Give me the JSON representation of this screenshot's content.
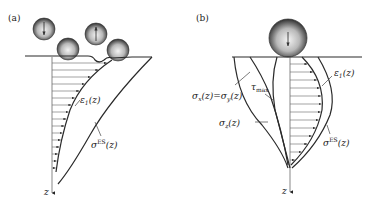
{
  "panels": [
    {
      "id": "a",
      "label": "(a)",
      "curve_labels": {
        "eps_main": "ε",
        "eps_sub": "1",
        "eps_arg": "(z)",
        "sigma_main": "σ",
        "sigma_sup": "ES",
        "sigma_arg": "(z)"
      },
      "axis_label": "z",
      "spheres": [
        {
          "role": "falling",
          "arrow": "down"
        },
        {
          "role": "resting"
        },
        {
          "role": "rebounding",
          "arrow": "up"
        },
        {
          "role": "resting"
        }
      ]
    },
    {
      "id": "b",
      "label": "(b)",
      "curve_labels": {
        "sxy": "σx(z)=σy(z)",
        "sxy_a": "σ",
        "sxy_a_sub": "x",
        "sxy_mid": "(z)=",
        "sxy_b": "σ",
        "sxy_b_sub": "y",
        "sxy_end": "(z)",
        "sz_main": "σ",
        "sz_sub": "z",
        "sz_arg": "(z)",
        "tau_main": "τ",
        "tau_sub": "max",
        "eps_main": "ε",
        "eps_sub": "1",
        "eps_arg": "(z)",
        "sigma_main": "σ",
        "sigma_sup": "ES",
        "sigma_arg": "(z)"
      },
      "axis_label": "z",
      "spheres": [
        {
          "role": "impacting",
          "arrow": "down"
        }
      ]
    }
  ]
}
